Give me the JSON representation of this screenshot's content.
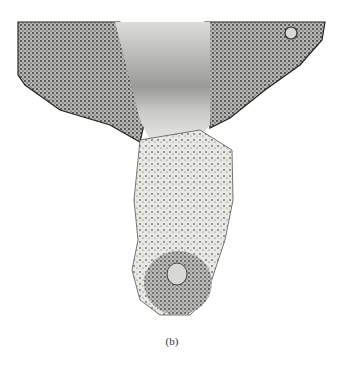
{
  "figure": {
    "caption": "(b)",
    "colors": {
      "background": "#ffffff",
      "tissue_dark": "#2a2a2a",
      "tissue_mid": "#8a8a8a",
      "tissue_light": "#e6e6e4"
    }
  }
}
